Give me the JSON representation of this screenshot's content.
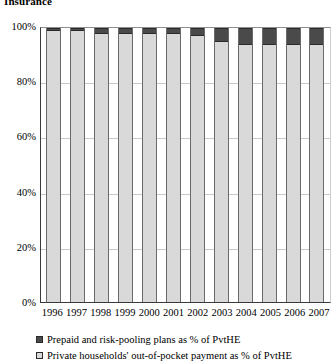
{
  "chart_data": {
    "type": "bar",
    "stacked": true,
    "percent_stacked": true,
    "title": "Insurance",
    "xlabel": "",
    "ylabel": "",
    "ylim": [
      0,
      100
    ],
    "yticks": [
      "0%",
      "20%",
      "40%",
      "60%",
      "80%",
      "100%"
    ],
    "ytick_values": [
      0,
      20,
      40,
      60,
      80,
      100
    ],
    "grid": true,
    "legend_position": "bottom",
    "categories": [
      "1996",
      "1997",
      "1998",
      "1999",
      "2000",
      "2001",
      "2002",
      "2003",
      "2004",
      "2005",
      "2006",
      "2007"
    ],
    "series": [
      {
        "name": "Prepaid and risk-pooling plans as % of PvtHE",
        "color": "#4a4a4a",
        "values": [
          1,
          1,
          2,
          2,
          2,
          2,
          3,
          5,
          6,
          6,
          6,
          6
        ]
      },
      {
        "name": "Private households' out-of-pocket payment as % of PvtHE",
        "color": "#d9d9d9",
        "values": [
          99,
          99,
          98,
          98,
          98,
          98,
          97,
          95,
          94,
          94,
          94,
          94
        ]
      }
    ]
  },
  "legend": {
    "items": [
      {
        "label": "Prepaid and risk-pooling plans as % of PvtHE",
        "color": "#4a4a4a"
      },
      {
        "label": "Private households' out-of-pocket payment as % of PvtHE",
        "color": "#d9d9d9"
      }
    ]
  }
}
